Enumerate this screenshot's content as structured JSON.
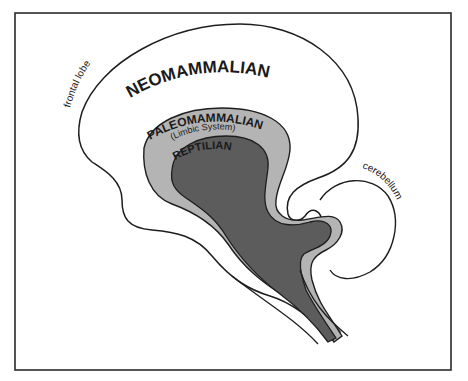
{
  "diagram": {
    "frame_color": "#2a2a2a",
    "colors": {
      "background": "#ffffff",
      "outline": "#1e1e1e",
      "neomammalian_fill": "#ffffff",
      "paleomammalian_fill": "#b4b4b4",
      "reptilian_fill": "#5c5c5c"
    },
    "labels": {
      "neomammalian": "NEOMAMMALIAN",
      "paleomammalian": "PALEOMAMMALIAN",
      "limbic": "(Limbic System)",
      "reptilian": "REPTILIAN",
      "frontal_lobe": "frontal lobe",
      "cerebellum": "cerebellum"
    }
  }
}
